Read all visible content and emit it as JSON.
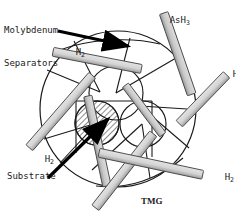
{
  "figure": {
    "background_color": "#ffffff",
    "line_color": "#1a1a1a",
    "rod_fill": "#d2d2d2",
    "rod_shade": "#9a9a9a",
    "hatch_color": "#2b2b2b",
    "arrow_color": "#000000"
  },
  "labels": {
    "molybdenum": {
      "line1": "Molybdenum",
      "line2": "Separators"
    },
    "ash3": {
      "base": "AsH",
      "subscript": "3"
    },
    "substrate": "Substrate",
    "tmg": "TMG",
    "h2": {
      "base": "H",
      "subscript": "2"
    },
    "h2_instances": [
      {
        "id": "h2-top-left",
        "x": 54,
        "y": 36
      },
      {
        "id": "h2-right-upper",
        "x": 211,
        "y": 58
      },
      {
        "id": "h2-left-lower",
        "x": 23,
        "y": 143
      },
      {
        "id": "h2-right-lower",
        "x": 203,
        "y": 161
      }
    ]
  },
  "chamber": {
    "outer_circle": {
      "cx": 118,
      "cy": 109,
      "r": 78
    },
    "inner_circles": [
      {
        "name": "circle-upper",
        "cx": 115,
        "cy": 94,
        "r": 27
      },
      {
        "name": "circle-left-substrate",
        "cx": 97,
        "cy": 123,
        "r": 22,
        "hatched": true
      },
      {
        "name": "circle-right",
        "cx": 143,
        "cy": 124,
        "r": 23
      }
    ]
  },
  "rods": [
    {
      "name": "rod-top-left",
      "x1": 56,
      "y1": 50,
      "x2": 140,
      "y2": 67,
      "w": 8
    },
    {
      "name": "rod-upper-right-steep",
      "x1": 163,
      "y1": 15,
      "x2": 190,
      "y2": 95,
      "w": 8
    },
    {
      "name": "rod-right-diagonal",
      "x1": 182,
      "y1": 120,
      "x2": 228,
      "y2": 73,
      "w": 8
    },
    {
      "name": "rod-left-diagonal",
      "x1": 32,
      "y1": 144,
      "x2": 93,
      "y2": 73,
      "w": 8
    },
    {
      "name": "rod-center-left-vertical",
      "x1": 89,
      "y1": 98,
      "x2": 108,
      "y2": 185
    },
    {
      "name": "rod-bottom-center",
      "x1": 95,
      "y1": 205,
      "x2": 152,
      "y2": 131,
      "w": 8
    },
    {
      "name": "rod-bottom-right",
      "x1": 103,
      "y1": 154,
      "x2": 205,
      "y2": 176,
      "w": 8
    },
    {
      "name": "rod-inner-right",
      "x1": 127,
      "y1": 88,
      "x2": 163,
      "y2": 136,
      "w": 7
    }
  ],
  "arrows": [
    {
      "name": "arrow-separator-pointer",
      "x1": 57,
      "y1": 31,
      "x2": 131,
      "y2": 47,
      "label_ref": "molybdenum"
    },
    {
      "name": "arrow-substrate-pointer",
      "x1": 49,
      "y1": 177,
      "x2": 110,
      "y2": 118,
      "label_ref": "substrate"
    }
  ],
  "gas_legend": [
    {
      "species": "AsH3",
      "position": "top"
    },
    {
      "species": "H2",
      "position": "multiple"
    },
    {
      "species": "TMG",
      "position": "bottom"
    }
  ]
}
